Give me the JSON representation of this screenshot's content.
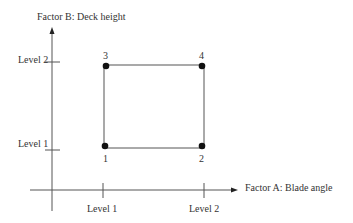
{
  "diagram": {
    "type": "factorial-design-2x2",
    "y_axis_label": "Factor B: Deck height",
    "x_axis_label": "Factor A: Blade angle",
    "y_ticks": [
      "Level 1",
      "Level 2"
    ],
    "x_ticks": [
      "Level 1",
      "Level 2"
    ],
    "points": [
      {
        "id": "1",
        "a": "Level 1",
        "b": "Level 1"
      },
      {
        "id": "2",
        "a": "Level 2",
        "b": "Level 1"
      },
      {
        "id": "3",
        "a": "Level 1",
        "b": "Level 2"
      },
      {
        "id": "4",
        "a": "Level 2",
        "b": "Level 2"
      }
    ],
    "colors": {
      "line": "#555555",
      "point": "#111111",
      "text": "#333333"
    }
  }
}
